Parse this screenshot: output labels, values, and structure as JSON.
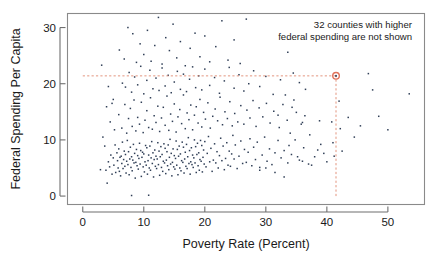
{
  "figure": {
    "background_color": "#ffffff",
    "frame_color": "#8a8a8a"
  },
  "annotation": {
    "line1": "32 counties with higher",
    "line2": "federal spending are not shown",
    "color": "#1a1a1a"
  },
  "highlight": {
    "marker_color": "#e0715a",
    "guide_color": "#e0896f",
    "x": 41.5,
    "y": 21.4
  },
  "chart_data": {
    "type": "scatter",
    "title": "",
    "xlabel": "Poverty Rate (Percent)",
    "ylabel": "Federal Spending Per Capita",
    "xlim": [
      -2.5,
      56
    ],
    "ylim": [
      -1.5,
      32.5
    ],
    "xticks": [
      0,
      10,
      20,
      30,
      40,
      50
    ],
    "yticks": [
      0,
      10,
      20,
      30
    ],
    "xtick_labels": [
      "0",
      "10",
      "20",
      "30",
      "40",
      "50"
    ],
    "ytick_labels": [
      "0",
      "10",
      "20",
      "30"
    ],
    "grid": false,
    "legend": false,
    "point_color": "#2f3e56",
    "point_size": 1.5,
    "annotations": [
      {
        "text": "32 counties with higher federal spending are not shown",
        "x": 38,
        "y": 31
      }
    ],
    "highlight_point": {
      "x": 41.5,
      "y": 21.4,
      "color": "#e0715a"
    },
    "reference_lines": [
      {
        "orientation": "horizontal",
        "value": 21.4,
        "from": 0,
        "to": 41.5,
        "style": "dashed",
        "color": "#e0896f"
      },
      {
        "orientation": "vertical",
        "value": 41.5,
        "from": 0,
        "to": 21.4,
        "style": "dashed",
        "color": "#e0896f"
      }
    ],
    "points": [
      [
        2.9,
        4.7
      ],
      [
        3.1,
        23.3
      ],
      [
        3.3,
        10.5
      ],
      [
        3.6,
        8.9
      ],
      [
        3.8,
        4.6
      ],
      [
        4.0,
        2.3
      ],
      [
        4.2,
        6.1
      ],
      [
        4.4,
        5.2
      ],
      [
        4.6,
        7.3
      ],
      [
        4.8,
        3.9
      ],
      [
        5.0,
        6.8
      ],
      [
        5.1,
        5.5
      ],
      [
        5.3,
        9.1
      ],
      [
        5.4,
        4.2
      ],
      [
        5.6,
        7.7
      ],
      [
        5.7,
        6.3
      ],
      [
        5.8,
        5.0
      ],
      [
        5.9,
        8.4
      ],
      [
        6.0,
        4.4
      ],
      [
        6.1,
        6.9
      ],
      [
        6.2,
        3.6
      ],
      [
        6.3,
        7.1
      ],
      [
        6.4,
        5.8
      ],
      [
        6.5,
        9.6
      ],
      [
        6.6,
        4.9
      ],
      [
        6.7,
        6.5
      ],
      [
        6.8,
        8.0
      ],
      [
        6.9,
        5.3
      ],
      [
        7.0,
        7.4
      ],
      [
        7.1,
        4.1
      ],
      [
        7.2,
        6.2
      ],
      [
        7.3,
        9.9
      ],
      [
        7.4,
        5.6
      ],
      [
        7.5,
        7.9
      ],
      [
        7.6,
        3.8
      ],
      [
        7.7,
        6.6
      ],
      [
        7.8,
        8.7
      ],
      [
        7.9,
        5.1
      ],
      [
        8.0,
        7.0
      ],
      [
        8.1,
        4.5
      ],
      [
        8.2,
        6.4
      ],
      [
        8.3,
        9.2
      ],
      [
        8.4,
        5.9
      ],
      [
        8.5,
        7.6
      ],
      [
        8.6,
        3.2
      ],
      [
        8.7,
        6.0
      ],
      [
        8.8,
        8.3
      ],
      [
        8.9,
        5.4
      ],
      [
        9.0,
        7.2
      ],
      [
        9.1,
        4.8
      ],
      [
        9.2,
        6.7
      ],
      [
        9.3,
        9.4
      ],
      [
        9.4,
        5.7
      ],
      [
        9.5,
        8.1
      ],
      [
        9.6,
        3.5
      ],
      [
        9.7,
        6.9
      ],
      [
        9.8,
        7.8
      ],
      [
        9.9,
        5.2
      ],
      [
        10.0,
        7.5
      ],
      [
        10.1,
        4.3
      ],
      [
        10.2,
        6.1
      ],
      [
        10.3,
        9.0
      ],
      [
        10.4,
        5.5
      ],
      [
        10.5,
        8.6
      ],
      [
        10.6,
        3.9
      ],
      [
        10.7,
        6.3
      ],
      [
        10.8,
        7.3
      ],
      [
        10.9,
        5.0
      ],
      [
        11.0,
        8.9
      ],
      [
        11.1,
        4.6
      ],
      [
        11.2,
        6.8
      ],
      [
        11.3,
        9.7
      ],
      [
        11.4,
        5.8
      ],
      [
        11.5,
        7.7
      ],
      [
        11.6,
        3.4
      ],
      [
        11.7,
        6.5
      ],
      [
        11.8,
        8.2
      ],
      [
        11.9,
        5.3
      ],
      [
        12.0,
        7.1
      ],
      [
        12.1,
        4.9
      ],
      [
        12.2,
        6.6
      ],
      [
        12.3,
        9.5
      ],
      [
        12.4,
        5.6
      ],
      [
        12.5,
        8.0
      ],
      [
        12.6,
        3.7
      ],
      [
        12.7,
        7.0
      ],
      [
        12.8,
        8.8
      ],
      [
        12.9,
        5.1
      ],
      [
        13.0,
        7.4
      ],
      [
        13.1,
        4.4
      ],
      [
        13.2,
        6.2
      ],
      [
        13.3,
        9.3
      ],
      [
        13.4,
        5.9
      ],
      [
        13.5,
        8.5
      ],
      [
        13.6,
        4.0
      ],
      [
        13.7,
        6.4
      ],
      [
        13.8,
        7.9
      ],
      [
        13.9,
        5.4
      ],
      [
        14.0,
        9.1
      ],
      [
        14.1,
        4.7
      ],
      [
        14.2,
        6.9
      ],
      [
        14.3,
        10.1
      ],
      [
        14.4,
        5.7
      ],
      [
        14.5,
        7.6
      ],
      [
        14.6,
        3.6
      ],
      [
        14.7,
        6.0
      ],
      [
        14.8,
        8.4
      ],
      [
        14.9,
        5.2
      ],
      [
        15.0,
        7.2
      ],
      [
        15.1,
        4.8
      ],
      [
        15.2,
        6.7
      ],
      [
        15.3,
        9.8
      ],
      [
        15.4,
        5.5
      ],
      [
        15.5,
        8.3
      ],
      [
        15.6,
        3.8
      ],
      [
        15.7,
        7.1
      ],
      [
        15.8,
        8.9
      ],
      [
        15.9,
        5.0
      ],
      [
        16.0,
        7.5
      ],
      [
        16.1,
        4.5
      ],
      [
        16.2,
        6.3
      ],
      [
        16.3,
        9.6
      ],
      [
        16.4,
        6.0
      ],
      [
        16.5,
        8.7
      ],
      [
        16.6,
        4.1
      ],
      [
        16.7,
        6.6
      ],
      [
        16.8,
        7.8
      ],
      [
        16.9,
        5.3
      ],
      [
        17.0,
        9.2
      ],
      [
        17.1,
        4.9
      ],
      [
        17.2,
        7.0
      ],
      [
        17.3,
        10.4
      ],
      [
        17.4,
        5.8
      ],
      [
        17.5,
        8.1
      ],
      [
        17.6,
        3.9
      ],
      [
        17.7,
        6.1
      ],
      [
        17.8,
        8.6
      ],
      [
        17.9,
        5.6
      ],
      [
        18.0,
        7.3
      ],
      [
        18.1,
        5.1
      ],
      [
        18.2,
        6.8
      ],
      [
        18.3,
        10.0
      ],
      [
        18.4,
        5.9
      ],
      [
        18.5,
        8.8
      ],
      [
        18.6,
        4.2
      ],
      [
        18.7,
        7.4
      ],
      [
        18.8,
        9.4
      ],
      [
        18.9,
        5.4
      ],
      [
        19.0,
        7.7
      ],
      [
        19.1,
        4.6
      ],
      [
        19.2,
        6.5
      ],
      [
        19.3,
        9.9
      ],
      [
        19.4,
        6.2
      ],
      [
        19.5,
        9.0
      ],
      [
        19.6,
        4.3
      ],
      [
        19.7,
        6.9
      ],
      [
        19.8,
        8.2
      ],
      [
        19.9,
        5.7
      ],
      [
        20.0,
        9.7
      ],
      [
        20.2,
        5.2
      ],
      [
        20.4,
        7.6
      ],
      [
        20.6,
        10.6
      ],
      [
        20.8,
        6.1
      ],
      [
        21.0,
        8.5
      ],
      [
        21.2,
        4.4
      ],
      [
        21.4,
        6.4
      ],
      [
        21.6,
        9.3
      ],
      [
        21.8,
        5.9
      ],
      [
        22.0,
        7.9
      ],
      [
        22.2,
        5.0
      ],
      [
        22.4,
        7.2
      ],
      [
        22.6,
        10.3
      ],
      [
        22.8,
        6.3
      ],
      [
        23.0,
        8.9
      ],
      [
        23.2,
        4.7
      ],
      [
        23.4,
        6.7
      ],
      [
        23.6,
        9.5
      ],
      [
        23.8,
        5.5
      ],
      [
        24.0,
        8.0
      ],
      [
        24.2,
        5.3
      ],
      [
        24.4,
        7.5
      ],
      [
        24.6,
        10.8
      ],
      [
        24.8,
        6.6
      ],
      [
        25.0,
        9.1
      ],
      [
        25.3,
        4.9
      ],
      [
        25.6,
        7.1
      ],
      [
        25.9,
        9.8
      ],
      [
        26.2,
        5.8
      ],
      [
        26.5,
        8.3
      ],
      [
        26.8,
        6.0
      ],
      [
        27.1,
        7.8
      ],
      [
        27.4,
        10.2
      ],
      [
        27.7,
        5.4
      ],
      [
        28.0,
        8.7
      ],
      [
        28.3,
        6.5
      ],
      [
        28.6,
        9.6
      ],
      [
        29.0,
        5.1
      ],
      [
        29.4,
        7.3
      ],
      [
        29.8,
        10.5
      ],
      [
        30.2,
        6.2
      ],
      [
        30.6,
        8.4
      ],
      [
        31.0,
        5.6
      ],
      [
        31.5,
        7.7
      ],
      [
        32.0,
        9.9
      ],
      [
        32.5,
        6.8
      ],
      [
        33.0,
        8.1
      ],
      [
        33.6,
        5.9
      ],
      [
        34.2,
        7.4
      ],
      [
        34.8,
        10.0
      ],
      [
        35.5,
        6.4
      ],
      [
        36.2,
        8.6
      ],
      [
        37.0,
        5.7
      ],
      [
        38.0,
        7.0
      ],
      [
        39.0,
        9.2
      ],
      [
        40.0,
        6.1
      ],
      [
        41.5,
        21.4
      ],
      [
        42.5,
        8.0
      ],
      [
        43.5,
        14.0
      ],
      [
        44.5,
        10.5
      ],
      [
        45.5,
        12.5
      ],
      [
        46.8,
        21.8
      ],
      [
        47.5,
        18.9
      ],
      [
        48.5,
        14.2
      ],
      [
        50.0,
        11.8
      ],
      [
        53.5,
        18.2
      ],
      [
        41.0,
        9.5
      ],
      [
        41.2,
        7.1
      ],
      [
        42.0,
        16.9
      ],
      [
        42.2,
        12.0
      ],
      [
        40.8,
        13.2
      ],
      [
        4.5,
        13.2
      ],
      [
        5.2,
        11.8
      ],
      [
        5.9,
        14.5
      ],
      [
        6.4,
        12.1
      ],
      [
        6.9,
        16.3
      ],
      [
        7.2,
        11.2
      ],
      [
        7.5,
        13.8
      ],
      [
        7.8,
        15.6
      ],
      [
        8.1,
        12.4
      ],
      [
        8.4,
        17.1
      ],
      [
        8.7,
        11.6
      ],
      [
        9.0,
        14.0
      ],
      [
        9.3,
        12.8
      ],
      [
        9.6,
        16.7
      ],
      [
        9.9,
        11.3
      ],
      [
        10.2,
        13.5
      ],
      [
        10.5,
        15.2
      ],
      [
        10.8,
        12.2
      ],
      [
        11.1,
        17.5
      ],
      [
        11.4,
        11.9
      ],
      [
        11.7,
        14.3
      ],
      [
        12.0,
        13.1
      ],
      [
        12.3,
        16.0
      ],
      [
        12.6,
        11.5
      ],
      [
        12.9,
        13.9
      ],
      [
        13.2,
        15.8
      ],
      [
        13.5,
        12.6
      ],
      [
        13.8,
        17.8
      ],
      [
        14.1,
        11.7
      ],
      [
        14.4,
        14.6
      ],
      [
        14.7,
        13.3
      ],
      [
        15.0,
        16.4
      ],
      [
        15.3,
        11.4
      ],
      [
        15.6,
        14.1
      ],
      [
        15.9,
        15.4
      ],
      [
        16.2,
        12.9
      ],
      [
        16.5,
        18.0
      ],
      [
        16.8,
        12.0
      ],
      [
        17.1,
        14.8
      ],
      [
        17.4,
        13.6
      ],
      [
        17.7,
        16.2
      ],
      [
        18.0,
        11.8
      ],
      [
        18.3,
        14.4
      ],
      [
        18.6,
        15.9
      ],
      [
        18.9,
        13.0
      ],
      [
        19.2,
        17.2
      ],
      [
        19.5,
        12.3
      ],
      [
        19.8,
        14.9
      ],
      [
        20.1,
        13.7
      ],
      [
        20.5,
        16.6
      ],
      [
        20.9,
        12.1
      ],
      [
        21.3,
        14.2
      ],
      [
        21.7,
        15.5
      ],
      [
        22.1,
        13.4
      ],
      [
        22.5,
        17.6
      ],
      [
        22.9,
        12.7
      ],
      [
        23.3,
        15.0
      ],
      [
        23.7,
        13.8
      ],
      [
        24.1,
        16.8
      ],
      [
        24.5,
        12.5
      ],
      [
        24.9,
        14.7
      ],
      [
        25.4,
        13.2
      ],
      [
        25.9,
        16.1
      ],
      [
        26.4,
        12.8
      ],
      [
        26.9,
        15.3
      ],
      [
        27.4,
        13.9
      ],
      [
        27.9,
        17.0
      ],
      [
        28.4,
        12.4
      ],
      [
        28.9,
        15.7
      ],
      [
        29.5,
        14.1
      ],
      [
        30.1,
        16.5
      ],
      [
        30.7,
        13.0
      ],
      [
        31.3,
        15.1
      ],
      [
        32.0,
        14.4
      ],
      [
        32.8,
        16.3
      ],
      [
        33.5,
        13.5
      ],
      [
        34.3,
        15.8
      ],
      [
        35.0,
        14.9
      ],
      [
        36.0,
        13.1
      ],
      [
        6.5,
        20.1
      ],
      [
        7.0,
        19.4
      ],
      [
        7.6,
        22.0
      ],
      [
        8.0,
        18.5
      ],
      [
        8.5,
        21.2
      ],
      [
        9.0,
        19.8
      ],
      [
        9.5,
        23.1
      ],
      [
        10.0,
        18.2
      ],
      [
        10.5,
        20.6
      ],
      [
        11.0,
        22.4
      ],
      [
        11.5,
        19.1
      ],
      [
        12.0,
        21.0
      ],
      [
        12.5,
        18.8
      ],
      [
        13.0,
        22.8
      ],
      [
        13.5,
        19.6
      ],
      [
        14.0,
        21.5
      ],
      [
        14.5,
        18.4
      ],
      [
        15.0,
        20.3
      ],
      [
        15.5,
        22.2
      ],
      [
        16.0,
        19.0
      ],
      [
        16.5,
        21.7
      ],
      [
        17.0,
        18.6
      ],
      [
        17.5,
        20.8
      ],
      [
        18.0,
        23.0
      ],
      [
        18.5,
        19.3
      ],
      [
        19.0,
        21.4
      ],
      [
        19.5,
        18.9
      ],
      [
        20.0,
        22.6
      ],
      [
        20.8,
        19.7
      ],
      [
        21.6,
        21.1
      ],
      [
        22.4,
        18.3
      ],
      [
        23.2,
        20.5
      ],
      [
        24.0,
        22.9
      ],
      [
        24.8,
        19.2
      ],
      [
        25.6,
        21.6
      ],
      [
        26.4,
        18.7
      ],
      [
        27.2,
        20.0
      ],
      [
        28.0,
        22.3
      ],
      [
        29.0,
        19.5
      ],
      [
        30.0,
        21.3
      ],
      [
        31.2,
        18.1
      ],
      [
        32.4,
        20.7
      ],
      [
        33.6,
        25.6
      ],
      [
        34.5,
        21.9
      ],
      [
        35.5,
        20.2
      ],
      [
        36.5,
        19.0
      ],
      [
        6.0,
        26.0
      ],
      [
        6.8,
        24.4
      ],
      [
        7.4,
        30.0
      ],
      [
        8.2,
        28.9
      ],
      [
        8.8,
        23.8
      ],
      [
        9.4,
        27.1
      ],
      [
        10.0,
        25.2
      ],
      [
        10.6,
        29.5
      ],
      [
        11.2,
        24.0
      ],
      [
        11.8,
        26.8
      ],
      [
        12.4,
        31.8
      ],
      [
        13.0,
        23.5
      ],
      [
        13.6,
        28.2
      ],
      [
        14.2,
        25.9
      ],
      [
        14.8,
        30.6
      ],
      [
        15.4,
        24.6
      ],
      [
        16.0,
        27.5
      ],
      [
        16.8,
        23.2
      ],
      [
        17.6,
        26.3
      ],
      [
        18.4,
        29.0
      ],
      [
        19.2,
        24.8
      ],
      [
        20.0,
        28.5
      ],
      [
        20.8,
        23.9
      ],
      [
        21.8,
        26.6
      ],
      [
        22.8,
        31.2
      ],
      [
        23.8,
        24.2
      ],
      [
        24.8,
        27.8
      ],
      [
        25.8,
        23.6
      ],
      [
        26.8,
        31.5
      ],
      [
        8.0,
        0.1
      ],
      [
        10.8,
        0.15
      ],
      [
        4.2,
        19.5
      ],
      [
        5.0,
        17.2
      ],
      [
        3.9,
        15.9
      ],
      [
        4.8,
        16.5
      ],
      [
        33.0,
        3.4
      ],
      [
        31.5,
        4.2
      ],
      [
        30.0,
        5.0
      ],
      [
        29.0,
        4.6
      ],
      [
        35.2,
        7.0
      ],
      [
        36.0,
        6.2
      ],
      [
        37.5,
        5.5
      ],
      [
        38.5,
        8.2
      ],
      [
        39.5,
        7.6
      ],
      [
        34.0,
        11.2
      ],
      [
        35.8,
        12.8
      ],
      [
        37.2,
        10.9
      ],
      [
        38.8,
        13.4
      ],
      [
        33.8,
        9.0
      ],
      [
        34.6,
        17.1
      ],
      [
        36.4,
        14.3
      ],
      [
        32.2,
        12.2
      ],
      [
        33.2,
        18.0
      ]
    ]
  }
}
